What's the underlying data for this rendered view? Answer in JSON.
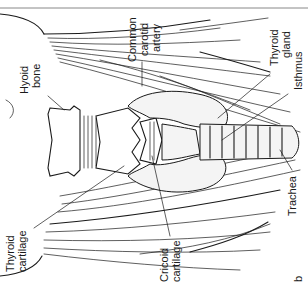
{
  "figure": {
    "panel_letter": "b",
    "orientation": "rotated 90 degrees counter-clockwise",
    "colors": {
      "ink": "#1a1a1a",
      "background": "#ffffff",
      "shading": "#f4f4f4"
    },
    "labels": {
      "hyoid_bone": [
        "Hyoid",
        "bone"
      ],
      "common_carotid_artery": [
        "Common",
        "carotid",
        "artery"
      ],
      "thyroid_gland": [
        "Thyroid",
        "gland"
      ],
      "isthmus": [
        "Isthmus"
      ],
      "thyroid_cartilage": [
        "Thyroid",
        "cartilage"
      ],
      "cricoid_cartilage": [
        "Cricoid",
        "cartilage"
      ],
      "trachea": [
        "Trachea"
      ]
    }
  }
}
